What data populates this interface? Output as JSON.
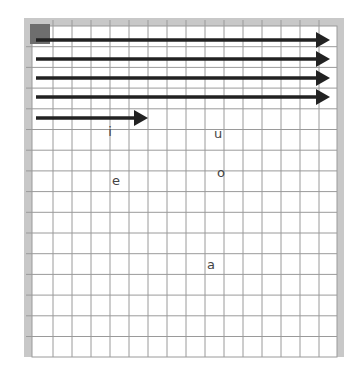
{
  "diagram": {
    "type": "grid-canvas",
    "frame": {
      "left": 24,
      "top": 18,
      "right": 344,
      "bottom": 357
    },
    "ruler_color": "#c8c8c8",
    "grid_color": "#9a9a9a",
    "corner_block_color": "#6e6e6e",
    "arrow_color": "#222222",
    "columns": 16,
    "rows": 16,
    "col_step": 19,
    "row_step": 20.7,
    "grid_origin": {
      "x": 34,
      "y": 26
    },
    "arrows": [
      {
        "id": "arrow-1",
        "x1": 36,
        "x2": 330,
        "y": 40
      },
      {
        "id": "arrow-2",
        "x1": 36,
        "x2": 330,
        "y": 59
      },
      {
        "id": "arrow-3",
        "x1": 36,
        "x2": 330,
        "y": 78
      },
      {
        "id": "arrow-4",
        "x1": 36,
        "x2": 330,
        "y": 97
      },
      {
        "id": "arrow-5",
        "x1": 36,
        "x2": 148,
        "y": 118
      }
    ],
    "letters": [
      {
        "id": "letter-i",
        "text": "i",
        "x": 110,
        "y": 136
      },
      {
        "id": "letter-u",
        "text": "u",
        "x": 218,
        "y": 138
      },
      {
        "id": "letter-e",
        "text": "e",
        "x": 116,
        "y": 185
      },
      {
        "id": "letter-o",
        "text": "o",
        "x": 221,
        "y": 177
      },
      {
        "id": "letter-a",
        "text": "a",
        "x": 211,
        "y": 269
      }
    ]
  }
}
